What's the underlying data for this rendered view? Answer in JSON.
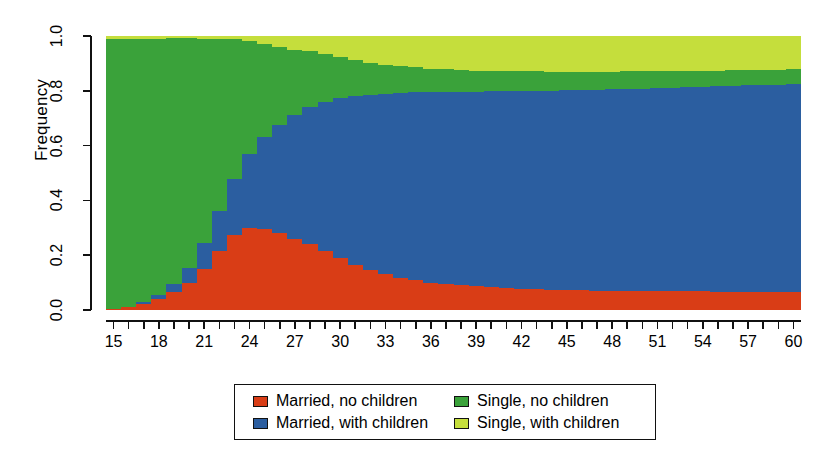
{
  "chart_data": {
    "type": "bar",
    "title": "",
    "subtitle": "",
    "xlabel": "",
    "ylabel": "Frequency",
    "stacked": true,
    "normalized": true,
    "grid": false,
    "legend_position": "bottom",
    "xlim": [
      15,
      61
    ],
    "ylim": [
      0.0,
      1.0
    ],
    "ytick_labels": [
      "0.0",
      "0.2",
      "0.4",
      "0.6",
      "0.8",
      "1.0"
    ],
    "ytick_values": [
      0.0,
      0.2,
      0.4,
      0.6,
      0.8,
      1.0
    ],
    "xtick_labels": [
      "15",
      "18",
      "21",
      "24",
      "27",
      "30",
      "33",
      "36",
      "39",
      "42",
      "45",
      "48",
      "51",
      "54",
      "57",
      "60"
    ],
    "xtick_values": [
      15,
      18,
      21,
      24,
      27,
      30,
      33,
      36,
      39,
      42,
      45,
      48,
      51,
      54,
      57,
      60
    ],
    "xtick_minor_values": [
      15,
      16,
      17,
      18,
      19,
      20,
      21,
      22,
      23,
      24,
      25,
      26,
      27,
      28,
      29,
      30,
      31,
      32,
      33,
      34,
      35,
      36,
      37,
      38,
      39,
      40,
      41,
      42,
      43,
      44,
      45,
      46,
      47,
      48,
      49,
      50,
      51,
      52,
      53,
      54,
      55,
      56,
      57,
      58,
      59,
      60
    ],
    "categories": [
      15,
      16,
      17,
      18,
      19,
      20,
      21,
      22,
      23,
      24,
      25,
      26,
      27,
      28,
      29,
      30,
      31,
      32,
      33,
      34,
      35,
      36,
      37,
      38,
      39,
      40,
      41,
      42,
      43,
      44,
      45,
      46,
      47,
      48,
      49,
      50,
      51,
      52,
      53,
      54,
      55,
      56,
      57,
      58,
      59,
      60
    ],
    "series": [
      {
        "name": "Married, no children",
        "color": "#d93d16",
        "values": [
          0.005,
          0.01,
          0.022,
          0.04,
          0.065,
          0.1,
          0.15,
          0.215,
          0.275,
          0.3,
          0.295,
          0.28,
          0.26,
          0.24,
          0.215,
          0.19,
          0.165,
          0.145,
          0.13,
          0.118,
          0.108,
          0.1,
          0.095,
          0.09,
          0.086,
          0.083,
          0.08,
          0.078,
          0.076,
          0.074,
          0.073,
          0.072,
          0.071,
          0.07,
          0.07,
          0.069,
          0.069,
          0.068,
          0.068,
          0.068,
          0.067,
          0.067,
          0.067,
          0.066,
          0.066,
          0.065
        ]
      },
      {
        "name": "Married, with children",
        "color": "#2b5ea0",
        "values": [
          0.0,
          0.002,
          0.006,
          0.014,
          0.03,
          0.055,
          0.095,
          0.145,
          0.205,
          0.27,
          0.335,
          0.395,
          0.45,
          0.5,
          0.545,
          0.585,
          0.615,
          0.64,
          0.66,
          0.675,
          0.686,
          0.694,
          0.7,
          0.706,
          0.711,
          0.715,
          0.719,
          0.722,
          0.725,
          0.727,
          0.729,
          0.731,
          0.733,
          0.735,
          0.737,
          0.739,
          0.741,
          0.743,
          0.745,
          0.747,
          0.749,
          0.751,
          0.753,
          0.755,
          0.757,
          0.76
        ]
      },
      {
        "name": "Single, no children",
        "color": "#3aa23a",
        "values": [
          0.985,
          0.978,
          0.962,
          0.936,
          0.896,
          0.836,
          0.744,
          0.628,
          0.508,
          0.411,
          0.34,
          0.285,
          0.24,
          0.204,
          0.174,
          0.15,
          0.132,
          0.117,
          0.106,
          0.098,
          0.092,
          0.087,
          0.083,
          0.08,
          0.077,
          0.075,
          0.073,
          0.071,
          0.07,
          0.069,
          0.068,
          0.067,
          0.066,
          0.065,
          0.064,
          0.063,
          0.062,
          0.061,
          0.06,
          0.059,
          0.058,
          0.057,
          0.056,
          0.055,
          0.054,
          0.053
        ]
      },
      {
        "name": "Single, with children",
        "color": "#c5de3c",
        "values": [
          0.01,
          0.01,
          0.01,
          0.01,
          0.009,
          0.009,
          0.011,
          0.012,
          0.012,
          0.019,
          0.03,
          0.04,
          0.05,
          0.056,
          0.066,
          0.075,
          0.088,
          0.098,
          0.104,
          0.109,
          0.114,
          0.119,
          0.122,
          0.124,
          0.126,
          0.127,
          0.128,
          0.129,
          0.129,
          0.13,
          0.13,
          0.13,
          0.13,
          0.13,
          0.129,
          0.129,
          0.128,
          0.128,
          0.127,
          0.126,
          0.126,
          0.125,
          0.124,
          0.124,
          0.123,
          0.122
        ]
      }
    ]
  },
  "axes": {
    "y_title": "Frequency"
  },
  "legend": {
    "entries": [
      {
        "label": "Married, no children",
        "color": "#d93d16"
      },
      {
        "label": "Single, no children",
        "color": "#3aa23a"
      },
      {
        "label": "Married, with children",
        "color": "#2b5ea0"
      },
      {
        "label": "Single, with children",
        "color": "#c5de3c"
      }
    ]
  }
}
